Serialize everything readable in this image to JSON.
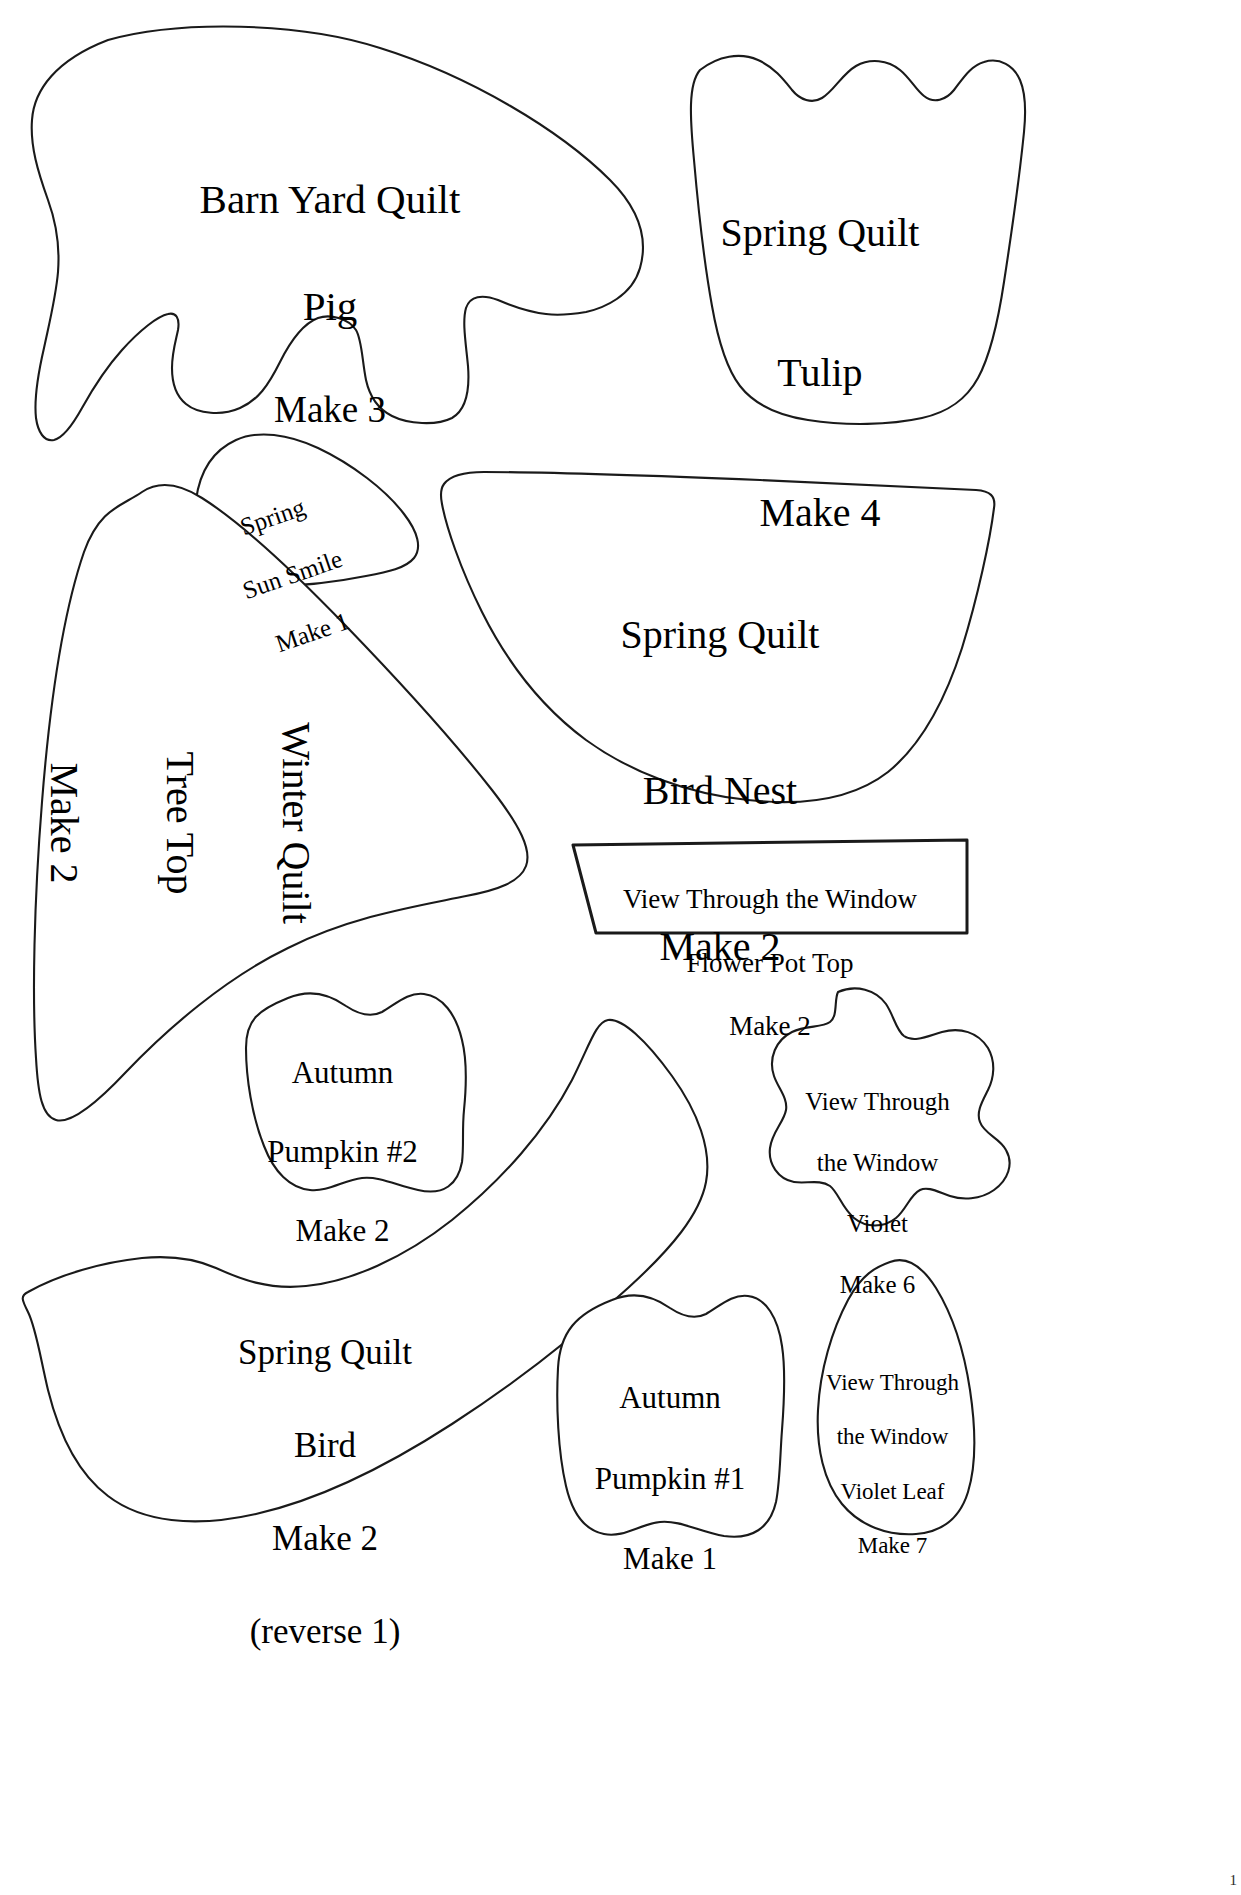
{
  "page": {
    "background_color": "#ffffff",
    "line_color": "#1a1a1a",
    "page_number": "1",
    "width": 1241,
    "height": 1895
  },
  "pieces": [
    {
      "id": "pig",
      "name": "Barn Yard Quilt Pig",
      "quilt": "Barn Yard Quilt",
      "part": "Pig",
      "quantity": "Make 3",
      "lines": [
        "Barn Yard Quilt",
        "Pig",
        "Make 3"
      ],
      "rotation_deg": 0
    },
    {
      "id": "tulip",
      "name": "Spring Quilt Tulip",
      "quilt": "Spring Quilt",
      "part": "Tulip",
      "quantity": "Make 4",
      "lines": [
        "Spring Quilt",
        "Tulip",
        "Make 4"
      ],
      "rotation_deg": 0
    },
    {
      "id": "sun-smile",
      "name": "Spring Sun Smile",
      "quilt": "Spring",
      "part": "Sun Smile",
      "quantity": "Make 1",
      "lines": [
        "Spring",
        "Sun Smile",
        "Make 1"
      ],
      "rotation_deg": -19
    },
    {
      "id": "bird-nest",
      "name": "Spring Quilt Bird Nest",
      "quilt": "Spring Quilt",
      "part": "Bird Nest",
      "quantity": "Make 2",
      "lines": [
        "Spring Quilt",
        "Bird Nest",
        "Make 2"
      ],
      "rotation_deg": 0
    },
    {
      "id": "tree-top",
      "name": "Winter Quilt Tree Top",
      "quilt": "Winter Quilt",
      "part": "Tree Top",
      "quantity": "Make 2",
      "lines": [
        "Winter Quilt",
        "Tree Top",
        "Make 2"
      ],
      "rotation_deg": 90
    },
    {
      "id": "flower-pot-top",
      "name": "View Through the Window Flower Pot Top",
      "quilt": "View Through the Window",
      "part": "Flower Pot Top",
      "quantity": "Make 2",
      "lines": [
        "View Through the Window",
        "Flower Pot Top",
        "Make 2"
      ],
      "rotation_deg": 0
    },
    {
      "id": "pumpkin-2",
      "name": "Autumn Pumpkin #2",
      "quilt": "Autumn",
      "part": "Pumpkin #2",
      "quantity": "Make 2",
      "lines": [
        "Autumn",
        "Pumpkin #2",
        "Make 2"
      ],
      "rotation_deg": 0
    },
    {
      "id": "violet",
      "name": "View Through the Window Violet",
      "quilt": "View Through",
      "part": "the Window Violet",
      "quantity": "Make 6",
      "lines": [
        "View Through",
        "the Window",
        "Violet",
        "Make 6"
      ],
      "rotation_deg": 0
    },
    {
      "id": "bird",
      "name": "Spring Quilt Bird",
      "quilt": "Spring Quilt",
      "part": "Bird",
      "quantity": "Make 2",
      "note": "(reverse 1)",
      "lines": [
        "Spring Quilt",
        "Bird",
        "Make 2",
        "(reverse 1)"
      ],
      "rotation_deg": 0
    },
    {
      "id": "pumpkin-1",
      "name": "Autumn Pumpkin #1",
      "quilt": "Autumn",
      "part": "Pumpkin #1",
      "quantity": "Make 1",
      "lines": [
        "Autumn",
        "Pumpkin #1",
        "Make 1"
      ],
      "rotation_deg": 0
    },
    {
      "id": "violet-leaf",
      "name": "View Through the Window Violet Leaf",
      "quilt": "View Through",
      "part": "the Window Violet Leaf",
      "quantity": "Make 7",
      "lines": [
        "View Through",
        "the Window",
        "Violet Leaf",
        "Make 7"
      ],
      "rotation_deg": 0
    }
  ],
  "labels": {
    "pig": {
      "line1": "Barn Yard Quilt",
      "line2": "Pig",
      "line3": "Make 3"
    },
    "tulip": {
      "line1": "Spring Quilt",
      "line2": "Tulip",
      "line3": "Make 4"
    },
    "sun_smile": {
      "line1": "Spring",
      "line2": "Sun Smile",
      "line3": "Make 1"
    },
    "bird_nest": {
      "line1": "Spring Quilt",
      "line2": "Bird Nest",
      "line3": "Make 2"
    },
    "tree_top": {
      "line1": "Winter Quilt",
      "line2": "Tree Top",
      "line3": "Make 2"
    },
    "flower_pot_top": {
      "line1": "View Through the Window",
      "line2": "Flower Pot Top",
      "line3": "Make 2"
    },
    "pumpkin_2": {
      "line1": "Autumn",
      "line2": "Pumpkin #2",
      "line3": "Make 2"
    },
    "violet": {
      "line1": "View Through",
      "line2": "the Window",
      "line3": "Violet",
      "line4": "Make 6"
    },
    "bird": {
      "line1": "Spring Quilt",
      "line2": "Bird",
      "line3": "Make 2",
      "line4": "(reverse 1)"
    },
    "pumpkin_1": {
      "line1": "Autumn",
      "line2": "Pumpkin #1",
      "line3": "Make 1"
    },
    "violet_leaf": {
      "line1": "View Through",
      "line2": "the Window",
      "line3": "Violet Leaf",
      "line4": "Make 7"
    }
  }
}
